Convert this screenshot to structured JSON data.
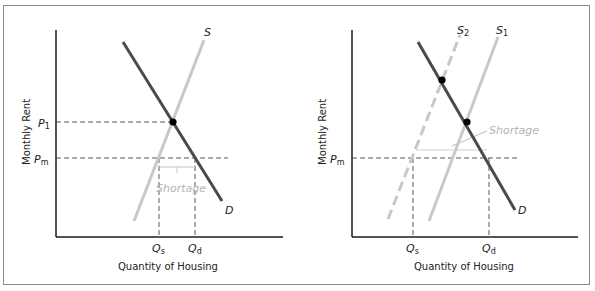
{
  "figure": {
    "panels": [
      {
        "id": "left",
        "title": "",
        "y_axis_label": "Monthly Rent",
        "x_axis_label": "Quantity of Housing",
        "curves": {
          "supply": "S",
          "demand": "D"
        },
        "price_labels": {
          "p1": {
            "main": "P",
            "sub": "1"
          },
          "pm": {
            "main": "P",
            "sub": "m"
          }
        },
        "quantity_labels": {
          "qs": {
            "main": "Q",
            "sub": "s"
          },
          "qd": {
            "main": "Q",
            "sub": "d"
          }
        },
        "annotation": "Shortage"
      },
      {
        "id": "right",
        "title": "",
        "y_axis_label": "Monthly Rent",
        "x_axis_label": "Quantity of Housing",
        "curves": {
          "supply1": {
            "main": "S",
            "sub": "1"
          },
          "supply2": {
            "main": "S",
            "sub": "2"
          },
          "demand": "D"
        },
        "price_labels": {
          "pm": {
            "main": "P",
            "sub": "m"
          }
        },
        "quantity_labels": {
          "qs": {
            "main": "Q",
            "sub": "s"
          },
          "qd": {
            "main": "Q",
            "sub": "d"
          }
        },
        "annotation": "Shortage"
      }
    ],
    "colors": {
      "demand": "#4a4a4a",
      "supply": "#c8c8c8",
      "axis": "#1a1a1a",
      "guide": "#444444",
      "annotation": "#b5b5b5"
    }
  }
}
